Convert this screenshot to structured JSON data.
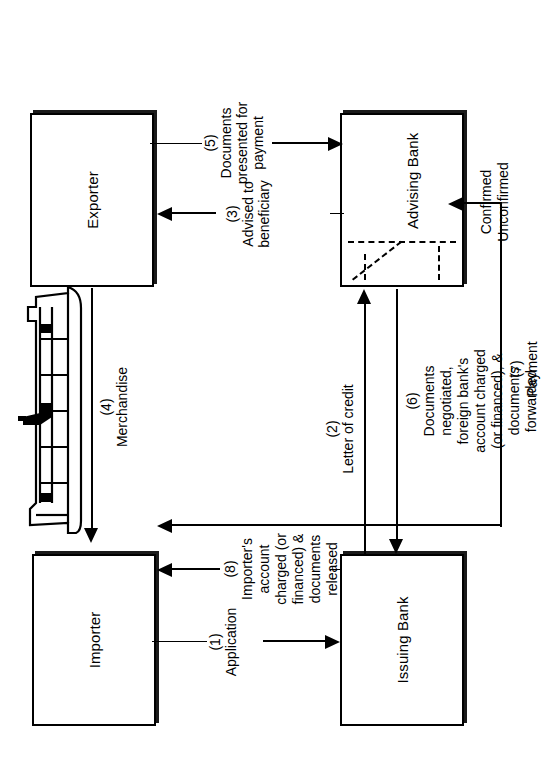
{
  "diagram": {
    "nodes": [
      {
        "id": "importer",
        "label": "Importer"
      },
      {
        "id": "issuing_bank",
        "label": "Issuing Bank"
      },
      {
        "id": "exporter",
        "label": "Exporter"
      },
      {
        "id": "advising_bank",
        "label": "Advising Bank"
      }
    ],
    "edges": [
      {
        "num": "(1)",
        "label": "(1)\nApplication",
        "from": "importer",
        "to": "issuing_bank"
      },
      {
        "num": "(2)",
        "label": "(2)\nLetter of credit",
        "from": "issuing_bank",
        "to": "advising_bank"
      },
      {
        "num": "(3)",
        "label": "(3)\nAdvised to\nbeneficiary",
        "from": "advising_bank",
        "to": "exporter"
      },
      {
        "num": "(4)",
        "label": "(4)\nMerchandise",
        "from": "exporter",
        "to": "importer"
      },
      {
        "num": "(5)",
        "label": "(5)\nDocuments\npresented for\npayment",
        "from": "exporter",
        "to": "advising_bank"
      },
      {
        "num": "(6)",
        "label": "(6)\nDocuments\nnegotiated,\nforeign bank's\naccount charged\n(or financed), &\ndocuments\nforwarded",
        "from": "advising_bank",
        "to": "issuing_bank"
      },
      {
        "num": "(7)",
        "label": "(7)\nPayment",
        "from": "advising_bank",
        "to": "exporter"
      },
      {
        "num": "(8)",
        "label": "(8)\nImporter's\naccount\ncharged (or\nfinanced) &\ndocuments\nreleased",
        "from": "issuing_bank",
        "to": "importer"
      }
    ],
    "annotations": {
      "advising_bank_states": "Confirmed\nUnconfirmed",
      "confirmed": "Confirmed",
      "unconfirmed": "Unconfirmed"
    },
    "illustration": {
      "name": "cargo-ship",
      "caption": "Merchandise"
    },
    "colors": {
      "ink": "#000000",
      "paper": "#ffffff",
      "shadow": "#1a1a1a"
    }
  }
}
